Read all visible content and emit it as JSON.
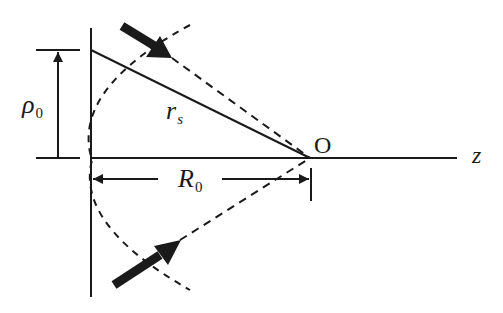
{
  "diagram": {
    "labels": {
      "rho": "ρ",
      "rho_sub": "0",
      "rs": "r",
      "rs_sub": "s",
      "R": "R",
      "R_sub": "0",
      "origin": "O",
      "axis": "z"
    },
    "colors": {
      "stroke": "#1a1a1a",
      "background": "#ffffff"
    }
  }
}
